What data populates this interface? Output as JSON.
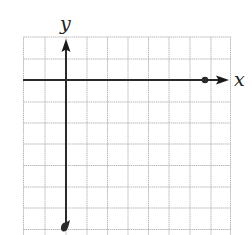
{
  "diagram": {
    "type": "coordinate-grid",
    "labels": {
      "x_axis": "x",
      "y_axis": "y"
    },
    "grid": {
      "columns": 10,
      "rows_visible": 9,
      "cell_size_px": 20.7,
      "line_color": "#b9b9b9"
    },
    "axes": {
      "color": "#2a2a2a",
      "origin_column": 2,
      "origin_row": 2,
      "x_axis_direction": "positive-right-arrow",
      "y_axis_direction": "positive-up-arrow"
    },
    "points": [
      {
        "name": "x-axis-endpoint",
        "grid_x": 7,
        "grid_y": 0
      },
      {
        "name": "y-axis-endpoint",
        "grid_x": 0,
        "grid_y": -7
      }
    ]
  }
}
